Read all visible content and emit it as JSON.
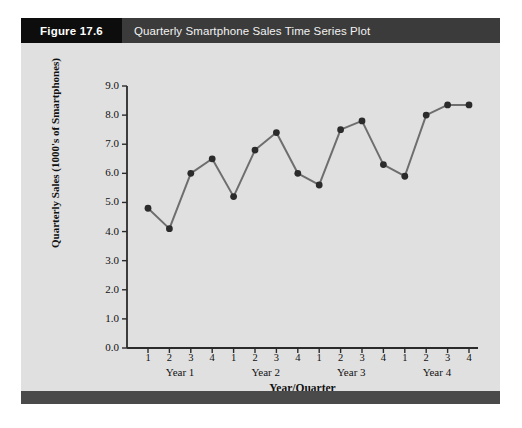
{
  "figure": {
    "number_label": "Figure 17.6",
    "title": "Quarterly Smartphone Sales Time Series Plot"
  },
  "colors": {
    "figure_number_bg": "#0d0d0d",
    "title_bar_bg": "#3b3b3b",
    "panel_bg": "#e0e0e0",
    "bottom_bar": "#4a4a4a",
    "line": "#6e6e6e",
    "marker": "#2b2b2b",
    "axis": "#2b2b2b"
  },
  "chart_data": {
    "type": "line",
    "title": "Quarterly Smartphone Sales Time Series Plot",
    "xlabel": "Year/Quarter",
    "ylabel": "Quarterly Sales (1000's of Smartphones)",
    "ylim": [
      0.0,
      9.0
    ],
    "ytick_labels": [
      "0.0",
      "1.0",
      "2.0",
      "3.0",
      "4.0",
      "5.0",
      "6.0",
      "7.0",
      "8.0",
      "9.0"
    ],
    "ytick_values": [
      0.0,
      1.0,
      2.0,
      3.0,
      4.0,
      5.0,
      6.0,
      7.0,
      8.0,
      9.0
    ],
    "grid": false,
    "legend": "none",
    "markers": true,
    "categories": [
      "1",
      "2",
      "3",
      "4",
      "1",
      "2",
      "3",
      "4",
      "1",
      "2",
      "3",
      "4",
      "1",
      "2",
      "3",
      "4"
    ],
    "x": [
      1,
      2,
      3,
      4,
      5,
      6,
      7,
      8,
      9,
      10,
      11,
      12,
      13,
      14,
      15,
      16
    ],
    "values": [
      4.8,
      4.1,
      6.0,
      6.5,
      5.2,
      6.8,
      7.4,
      6.0,
      5.6,
      7.5,
      7.8,
      6.3,
      5.9,
      8.0,
      8.35,
      8.35
    ],
    "group_labels": [
      "Year 1",
      "Year 2",
      "Year 3",
      "Year 4"
    ],
    "groups": [
      {
        "label": "Year 1",
        "quarters": [
          "1",
          "2",
          "3",
          "4"
        ],
        "values": [
          4.8,
          4.1,
          6.0,
          6.5
        ]
      },
      {
        "label": "Year 2",
        "quarters": [
          "1",
          "2",
          "3",
          "4"
        ],
        "values": [
          5.2,
          6.8,
          7.4,
          6.0
        ]
      },
      {
        "label": "Year 3",
        "quarters": [
          "1",
          "2",
          "3",
          "4"
        ],
        "values": [
          5.6,
          7.5,
          7.8,
          6.3
        ]
      },
      {
        "label": "Year 4",
        "quarters": [
          "1",
          "2",
          "3",
          "4"
        ],
        "values": [
          5.9,
          8.0,
          8.35,
          8.35
        ]
      }
    ]
  }
}
